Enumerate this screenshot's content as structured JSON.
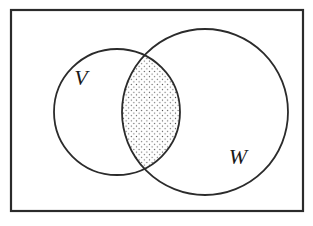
{
  "figure": {
    "type": "venn-diagram",
    "title": "",
    "caption": "",
    "background_color": "#ffffff",
    "stroke_color": "#2b2b2b",
    "fill_color": "#ffffff",
    "dot_color": "#555555",
    "universe_rect": {
      "name": "universal-set-rectangle",
      "x": 11,
      "y": 10,
      "width": 292,
      "height": 201,
      "stroke_width": 2.2
    },
    "circles": [
      {
        "id": "V",
        "label": "V",
        "name": "circle-v",
        "cx": 117,
        "cy": 112,
        "r": 63,
        "stroke_width": 1.8
      },
      {
        "id": "W",
        "label": "W",
        "name": "circle-w",
        "cx": 205,
        "cy": 112,
        "r": 83,
        "stroke_width": 1.8
      }
    ],
    "labels": [
      {
        "id": "label-v",
        "text": "V",
        "x": 81,
        "y": 85,
        "font_size": 22
      },
      {
        "id": "label-w",
        "text": "W",
        "x": 238,
        "y": 164,
        "font_size": 22
      }
    ],
    "shaded_region": {
      "name": "intersection-v-and-w",
      "description": "V ∩ W",
      "pattern": "dots",
      "dot_spacing": 5.2,
      "dot_radius": 0.62
    }
  },
  "chart_data": {
    "type": "diagram",
    "subtype": "venn",
    "title": "",
    "sets": [
      "V",
      "W"
    ],
    "shaded": [
      "V∩W"
    ],
    "legend": []
  }
}
